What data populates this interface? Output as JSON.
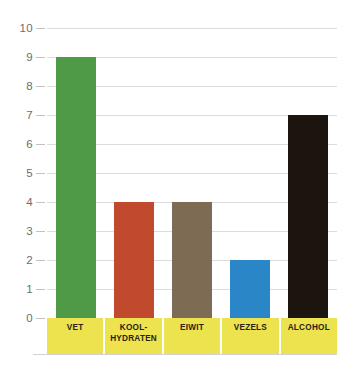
{
  "chart_data": {
    "type": "bar",
    "title": "",
    "subtitle": "",
    "xlabel": "",
    "ylabel": "",
    "categories": [
      "VET",
      "KOOL-\nHYDRATEN",
      "EIWIT",
      "VEZELS",
      "ALCOHOL"
    ],
    "values": [
      9,
      4,
      4,
      2,
      7
    ],
    "bar_colors": [
      "#4f9a47",
      "#c14a2e",
      "#7e6b54",
      "#2b86c8",
      "#1c140e"
    ],
    "ylim": [
      0,
      10
    ],
    "ytick_labels": [
      "10",
      "9",
      "8",
      "7",
      "6",
      "5",
      "4",
      "3",
      "2",
      "1",
      "0"
    ],
    "ytick_values": [
      10,
      9,
      8,
      7,
      6,
      5,
      4,
      3,
      2,
      1,
      0
    ],
    "grid": true,
    "legend": "none",
    "annotations": []
  },
  "style": {
    "grid_color": "#dcdcdc",
    "tick_color": "#6d6d6d",
    "category_strip_color": "#ece34f",
    "category_text_color": "#2b2115",
    "background": "#ffffff"
  }
}
